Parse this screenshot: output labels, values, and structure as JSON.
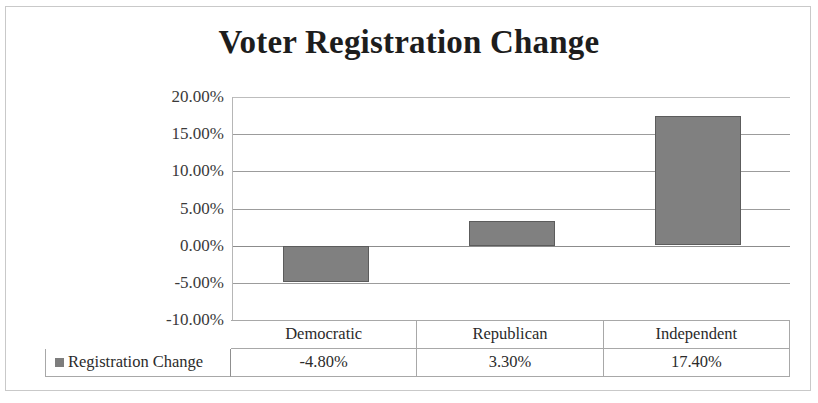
{
  "chart_data": {
    "type": "bar",
    "title": "Voter Registration Change",
    "xlabel": "",
    "ylabel": "",
    "categories": [
      "Democratic",
      "Republican",
      "Independent"
    ],
    "series": [
      {
        "name": "Registration Change",
        "values": [
          -4.8,
          3.3,
          17.4
        ],
        "value_labels": [
          "-4.80%",
          "3.30%",
          "17.40%"
        ],
        "color": "#808080"
      }
    ],
    "ylim": [
      -10,
      20
    ],
    "ytick_values": [
      20,
      15,
      10,
      5,
      0,
      -5,
      -10
    ],
    "ytick_labels": [
      "20.00%",
      "15.00%",
      "10.00%",
      "5.00%",
      "0.00%",
      "-5.00%",
      "-10.00%"
    ],
    "grid": true,
    "legend_position": "bottom-table",
    "units": "percent"
  },
  "legend": {
    "swatch_name": "series-color-swatch",
    "label": "Registration Change"
  },
  "table": {
    "header_row": [
      "Democratic",
      "Republican",
      "Independent"
    ],
    "value_row": [
      "-4.80%",
      "3.30%",
      "17.40%"
    ]
  }
}
